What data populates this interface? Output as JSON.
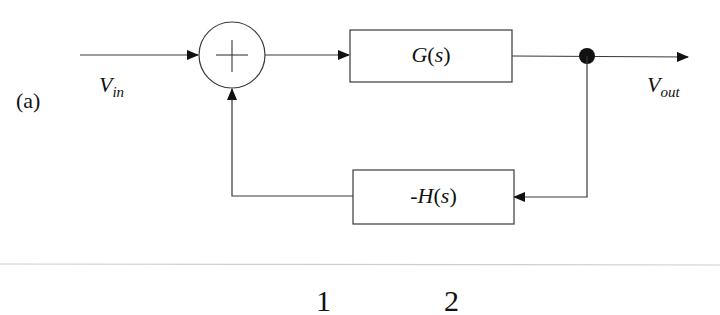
{
  "figure": {
    "tag": "(a)",
    "input_signal": {
      "main": "V",
      "sub": "in"
    },
    "output_signal": {
      "main": "V",
      "sub": "out"
    },
    "summing_junction": {
      "symbol": "+"
    },
    "forward_block": {
      "label": "G(s)"
    },
    "feedback_block": {
      "label": "-H(s)"
    },
    "partial_text_below": [
      "1",
      "2"
    ]
  },
  "colors": {
    "line": "#3a3a3a",
    "fill": "#111111",
    "background": "#ffffff",
    "separator": "#cfcfcf"
  }
}
